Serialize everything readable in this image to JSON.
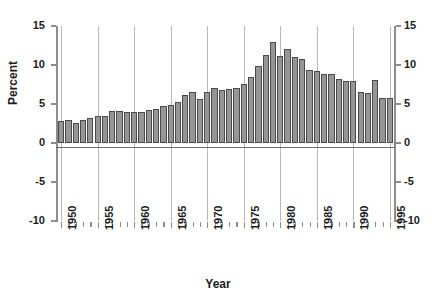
{
  "chart_data": {
    "type": "bar",
    "title": "",
    "xlabel": "Year",
    "ylabel": "Percent",
    "ylim": [
      -10,
      15
    ],
    "xlim": [
      1949.3,
      1995.7
    ],
    "yticks": [
      -10,
      -5,
      0,
      5,
      10,
      15
    ],
    "ytick_labels": [
      "-10",
      "-5",
      "0",
      "5",
      "10",
      "15"
    ],
    "xticks": [
      1950,
      1955,
      1960,
      1965,
      1970,
      1975,
      1980,
      1985,
      1990,
      1995
    ],
    "xtick_labels": [
      "1950",
      "1955",
      "1960",
      "1965",
      "1970",
      "1975",
      "1980",
      "1985",
      "1990",
      "1995"
    ],
    "grid": "vertical-only",
    "legend": "none",
    "bar_color": "#969696",
    "bar_edge_color": "#4a4a4a",
    "axis_color": "#8d8d8d",
    "grid_color": "#b9b9b9",
    "text_color": "#1c1c1c",
    "background": "#ffffff",
    "dual_y_axis": true,
    "categories": [
      1950,
      1951,
      1952,
      1953,
      1954,
      1955,
      1956,
      1957,
      1958,
      1959,
      1960,
      1961,
      1962,
      1963,
      1964,
      1965,
      1966,
      1967,
      1968,
      1969,
      1970,
      1971,
      1972,
      1973,
      1974,
      1975,
      1976,
      1977,
      1978,
      1979,
      1980,
      1981,
      1982,
      1983,
      1984,
      1985,
      1986,
      1987,
      1988,
      1989,
      1990,
      1991,
      1992,
      1993,
      1994,
      1995
    ],
    "values": [
      2.8,
      3.0,
      2.6,
      3.0,
      3.2,
      3.5,
      3.5,
      4.1,
      4.1,
      4.0,
      4.0,
      4.0,
      4.2,
      4.3,
      4.7,
      4.9,
      5.3,
      6.1,
      6.6,
      5.7,
      6.6,
      7.0,
      6.8,
      6.9,
      7.1,
      7.6,
      8.5,
      9.9,
      11.3,
      12.9,
      11.1,
      12.0,
      11.0,
      10.8,
      9.3,
      9.2,
      8.9,
      8.9,
      8.2,
      8.0,
      7.9,
      6.5,
      6.4,
      8.1,
      5.8,
      5.8
    ]
  },
  "axis_titles": {
    "y": "Percent",
    "x": "Year"
  }
}
